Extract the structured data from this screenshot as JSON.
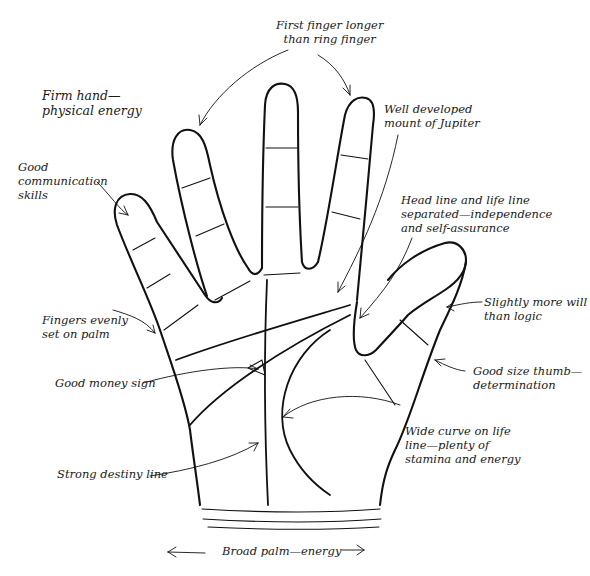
{
  "diagram": {
    "labels": {
      "first_finger": "First finger longer\nthan ring finger",
      "firm_hand": "Firm hand—\nphysical energy",
      "jupiter": "Well developed\nmount of Jupiter",
      "communication": "Good\ncommunication\nskills",
      "head_life": "Head line and life line\nseparated—independence\nand self-assurance",
      "fingers_even": "Fingers evenly\nset on palm",
      "will_logic": "Slightly more will\nthan logic",
      "money": "Good money sign",
      "thumb": "Good size thumb—\ndetermination",
      "life_curve": "Wide curve on life\nline—plenty of\nstamina and energy",
      "destiny": "Strong destiny line",
      "broad_palm": "Broad palm—energy"
    },
    "colors": {
      "ink": "#111111",
      "background": "#ffffff"
    }
  }
}
